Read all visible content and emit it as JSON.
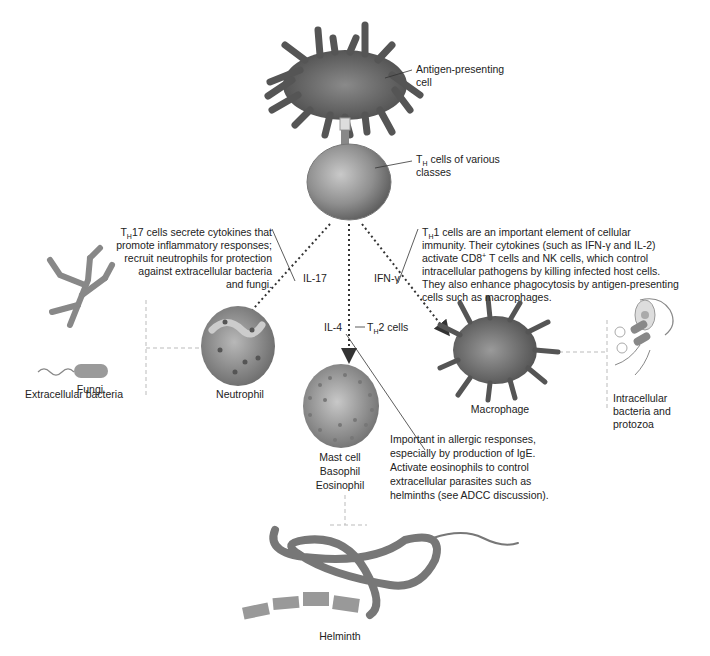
{
  "diagram": {
    "type": "immunology-flow",
    "colors": {
      "cell_gray": "#6e6e6e",
      "line": "#333333",
      "guide_dash": "#bbbbbb",
      "background": "#ffffff"
    }
  },
  "apc": {
    "label_line1": "Antigen-presenting",
    "label_line2": "cell"
  },
  "th": {
    "label_pre": "T",
    "label_sub": "H",
    "label_line1_rest": " cells of various",
    "label_line2": "classes"
  },
  "th17": {
    "desc_sub": "H",
    "desc_line1_rest": "17 cells secrete cytokines that",
    "desc_line2": "promote inflammatory responses;",
    "desc_line3": "recruit neutrophils for protection",
    "desc_line4": "against extracellular bacteria",
    "desc_line5": "and fungi.",
    "cytokine": "IL-17",
    "target": "Neutrophil"
  },
  "th1": {
    "desc_sub": "H",
    "desc_line1_rest": "1 cells are an important element of cellular",
    "desc_line2": "immunity. Their cytokines (such as IFN-γ and IL-2)",
    "desc_line3_pre": "activate CD8",
    "desc_line3_sup": "+",
    "desc_line3_rest": " T cells and NK cells, which control",
    "desc_line4": "intracellular pathogens by killing infected host cells.",
    "desc_line5": "They also enhance phagocytosis by antigen-presenting",
    "desc_line6": "cells such as macrophages.",
    "cytokine": "IFN-γ",
    "target": "Macrophage"
  },
  "th2": {
    "cytokine": "IL-4",
    "label_pre": "T",
    "label_sub": "H",
    "label_rest": "2 cells",
    "desc_line1": "Important in allergic responses,",
    "desc_line2": "especially by production of IgE.",
    "desc_line3": "Activate eosinophils to control",
    "desc_line4": "extracellular parasites such as",
    "desc_line5": "helminths (see ADCC discussion).",
    "target_line1": "Mast cell",
    "target_line2": "Basophil",
    "target_line3": "Eosinophil"
  },
  "pathogens": {
    "fungi": "Fungi",
    "extracellular_bacteria": "Extracellular bacteria",
    "intracellular_line1": "Intracellular",
    "intracellular_line2": "bacteria and",
    "intracellular_line3": "protozoa",
    "helminth": "Helminth"
  }
}
